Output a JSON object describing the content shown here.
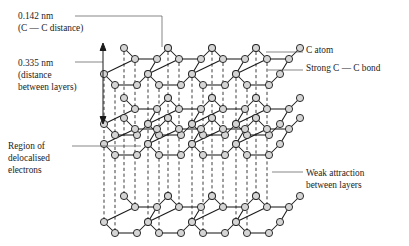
{
  "diagram": {
    "colors": {
      "atom_fill": "#d5d5d5",
      "atom_stroke": "#1a1a1a",
      "bond": "#1a1a1a",
      "dashed_line": "#1a1a1a",
      "leader": "#555555",
      "text": "#1c1c1c",
      "background": "#ffffff"
    },
    "labels": {
      "cc_distance": {
        "lines": [
          "0.142 nm",
          "(C — C distance)"
        ],
        "line1": "0.142 nm",
        "line2": "(C — C distance)"
      },
      "layer_distance": {
        "lines": [
          "0.335 nm",
          "(distance",
          "between layers)"
        ],
        "line1": "0.335 nm",
        "line2": "(distance",
        "line3": "between layers)"
      },
      "delocalised": {
        "lines": [
          "Region of",
          "delocalised",
          "electrons"
        ],
        "line1": "Region of",
        "line2": "delocalised",
        "line3": "electrons"
      },
      "c_atom": {
        "line1": "C atom"
      },
      "strong_bond": {
        "line1": "Strong C — C bond"
      },
      "weak_attraction": {
        "lines": [
          "Weak attraction",
          "between layers"
        ],
        "line1": "Weak attraction",
        "line2": "between layers"
      }
    },
    "measurements": [
      {
        "name": "carbon-carbon-distance",
        "value": 0.142,
        "unit": "nm"
      },
      {
        "name": "interlayer-distance",
        "value": 0.335,
        "unit": "nm"
      }
    ],
    "lattice": {
      "layer_count": 4,
      "layer_y": [
        48,
        98,
        118,
        196
      ],
      "cols": 4,
      "rows": 2,
      "hex_width": 44,
      "hex_height": 22,
      "depth_dx": -20,
      "depth_dy": 26,
      "origin_x": 124,
      "atom_radius": 3.6,
      "dashed_columns": 10
    }
  }
}
